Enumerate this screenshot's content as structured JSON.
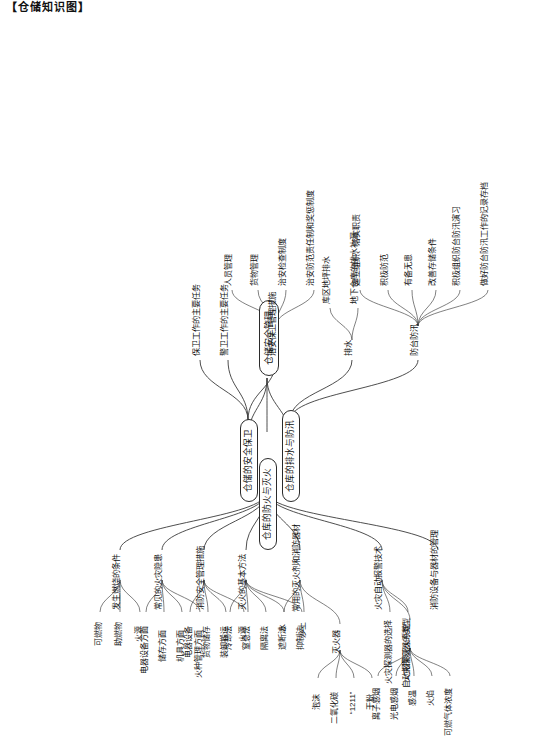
{
  "document": {
    "title": "【仓储知识图】",
    "orientation": "rotated-90",
    "root": "仓储安全管理",
    "accent": "#2b2b2b"
  },
  "map": {
    "root": {
      "label": "仓储安全管理"
    },
    "branches": [
      {
        "id": "fire",
        "label": "仓库的防火与灭火",
        "children": [
          {
            "label": "发生燃烧的条件",
            "leaves": [
              "可燃物",
              "助燃物",
              "火源"
            ]
          },
          {
            "label": "常见的火灾隐患",
            "leaves": [
              "电器设备方面",
              "储存方面",
              "机具方面",
              "火种管理方面"
            ]
          },
          {
            "label": "消防安全管理措施",
            "leaves": [
              "电器设备",
              "货物储存",
              "装卸搬运",
              "火源"
            ]
          },
          {
            "label": "灭火的基本方法",
            "leaves": [
              "冷却法",
              "窒息法",
              "隔离法",
              "遮断法",
              "抑制法"
            ]
          },
          {
            "label": "常用的灭火剂和消防器材",
            "leaves": [
              "水",
              "沙土"
            ],
            "groups": [
              {
                "label": "灭火器",
                "leaves": [
                  "泡沫",
                  "二氧化碳",
                  "“1211”",
                  "干粉"
                ]
              }
            ]
          },
          {
            "label": "火灾自动报警技术",
            "groups": [
              {
                "label": "火灾探测器的类型",
                "leaves": [
                  "离子感烟",
                  "光电感烟",
                  "感温",
                  "火焰",
                  "可燃气体浓度"
                ]
              }
            ],
            "leaves": [
              "火灾探测器的选择",
              "自动报警灭火系统"
            ]
          },
          {
            "label": "消防设备与器材的管理",
            "leaves": []
          }
        ]
      },
      {
        "id": "security",
        "label": "仓储的安全保卫",
        "children": [
          {
            "label": "保卫工作的主要任务",
            "leaves": []
          },
          {
            "label": "警卫工作的主要任务",
            "leaves": []
          },
          {
            "label": "治安保卫管理措施",
            "leaves": [
              "人员管理",
              "货物管理",
              "治安检查制度",
              "治安防范责任制和奖惩制度"
            ]
          }
        ]
      },
      {
        "id": "drainage",
        "label": "仓库的排水与防汛",
        "children": [
          {
            "label": "排水",
            "leaves": [
              "库区地坪排水",
              "地下仓库的排水补漏"
            ]
          },
          {
            "label": "防台防汛",
            "leaves": [
              "建立组织、落实职责",
              "积极防范",
              "有备无患",
              "改善存储条件",
              "积极组织防台防汛演习",
              "做好防台防汛工作的记录存档"
            ]
          }
        ]
      }
    ]
  }
}
